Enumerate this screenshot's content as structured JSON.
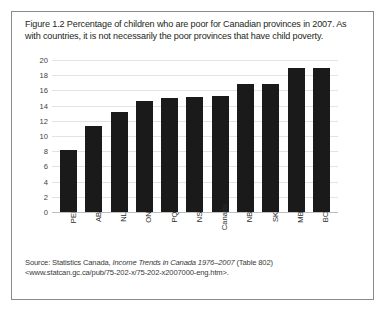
{
  "caption": {
    "text": "Figure 1.2 Percentage of children who are poor for Canadian provinces in 2007. As with countries, it is not necessarily the poor provinces that have child poverty."
  },
  "source": {
    "prefix": "Source: Statistics Canada, ",
    "italic_title": "Income Trends in Canada 1976–2007",
    "suffix": " (Table 802) <www.statcan.gc.ca/pub/75-202-x/75-202-x2007000-eng.htm>."
  },
  "chart_data": {
    "type": "bar",
    "title": "",
    "xlabel": "",
    "ylabel": "",
    "categories": [
      "PEI",
      "AB",
      "NL",
      "ON",
      "PQ",
      "NS",
      "Canada",
      "NB",
      "SK",
      "MB",
      "BC"
    ],
    "values": [
      8.2,
      11.3,
      13.2,
      14.6,
      15.0,
      15.1,
      15.2,
      16.9,
      16.9,
      19.0,
      19.0
    ],
    "ylim": [
      0,
      20
    ],
    "yticks": [
      20,
      18,
      16,
      14,
      12,
      10,
      8,
      6,
      4,
      2,
      0
    ],
    "grid": true,
    "legend": false,
    "bar_color": "#1a1a1a",
    "grid_color": "#e3e3e3"
  }
}
